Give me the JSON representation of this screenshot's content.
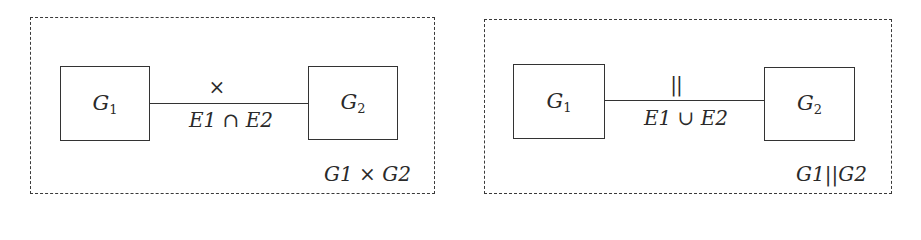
{
  "diagrams": [
    {
      "name": "product",
      "node1": {
        "base": "G",
        "sub": "1"
      },
      "node2": {
        "base": "G",
        "sub": "2"
      },
      "operator": "×",
      "edge_label": {
        "a": "E1",
        "op": "∩",
        "b": "E2"
      },
      "caption": {
        "a": "G1",
        "op": " × ",
        "b": "G2"
      }
    },
    {
      "name": "parallel",
      "node1": {
        "base": "G",
        "sub": "1"
      },
      "node2": {
        "base": "G",
        "sub": "2"
      },
      "operator": "||",
      "edge_label": {
        "a": "E1",
        "op": "∪",
        "b": "E2"
      },
      "caption": {
        "a": "G1",
        "op": "||",
        "b": "G2"
      }
    }
  ]
}
